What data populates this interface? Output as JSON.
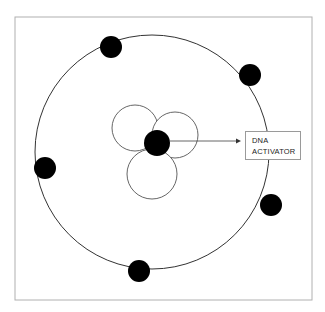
{
  "diagram": {
    "title": "",
    "frame": {
      "x": 15,
      "y": 17,
      "w": 297,
      "h": 283,
      "stroke": "#aaaaaa"
    },
    "orbit": {
      "cx": 152,
      "cy": 152,
      "r": 117,
      "stroke": "#333333"
    },
    "center_dot": {
      "cx": 157,
      "cy": 143,
      "r": 13,
      "fill": "#000000"
    },
    "small_circles": [
      {
        "cx": 135,
        "cy": 128,
        "r": 23
      },
      {
        "cx": 175,
        "cy": 135,
        "r": 23
      },
      {
        "cx": 152,
        "cy": 174,
        "r": 25
      }
    ],
    "outer_dots": [
      {
        "cx": 111,
        "cy": 47,
        "r": 11
      },
      {
        "cx": 250,
        "cy": 75,
        "r": 11
      },
      {
        "cx": 45,
        "cy": 168,
        "r": 11
      },
      {
        "cx": 271,
        "cy": 205,
        "r": 11
      },
      {
        "cx": 139,
        "cy": 271,
        "r": 11
      }
    ],
    "arrow": {
      "x1": 170,
      "y1": 141,
      "x2": 238,
      "y2": 141
    },
    "label": {
      "line1": "DNA",
      "line2": "ACTIVATOR"
    }
  }
}
